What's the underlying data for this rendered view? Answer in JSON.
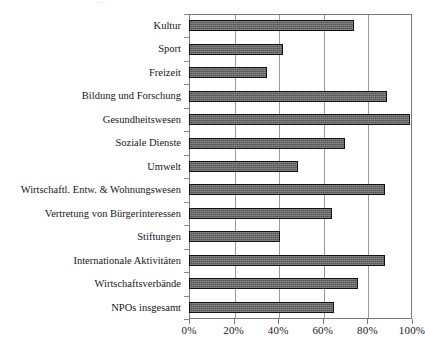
{
  "artifact": {
    "top_text": "....."
  },
  "chart_data": {
    "type": "bar",
    "orientation": "horizontal",
    "title": "",
    "xlabel": "",
    "ylabel": "",
    "xlim": [
      0,
      100
    ],
    "grid": true,
    "legend": "none",
    "xunit": "%",
    "tick_labels": [
      "0%",
      "20%",
      "40%",
      "60%",
      "80%",
      "100%"
    ],
    "tick_values": [
      0,
      20,
      40,
      60,
      80,
      100
    ],
    "categories": [
      "Kultur",
      "Sport",
      "Freizeit",
      "Bildung und Forschung",
      "Gesundheitswesen",
      "Soziale Dienste",
      "Umwelt",
      "Wirtschaftl. Entw. & Wohnungswesen",
      "Vertretung von Bürgerinteressen",
      "Stiftungen",
      "Internationale Aktivitäten",
      "Wirtschaftsverbände",
      "NPOs insgesamt"
    ],
    "values": [
      74,
      42,
      35,
      89,
      99,
      70,
      49,
      88,
      64,
      41,
      88,
      76,
      65
    ],
    "bar_color": "#5d5d5d",
    "bar_border_color": "#111111",
    "grid_color": "#9a9a9a",
    "frame_color": "#7a7a7a"
  }
}
